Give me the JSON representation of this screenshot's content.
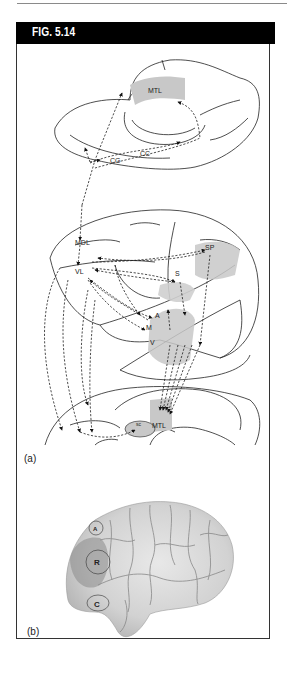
{
  "figure": {
    "title": "FIG. 5.14",
    "panels": [
      {
        "id": "a",
        "label": "(a)",
        "type": "schematic",
        "region_labels": [
          "MTL",
          "CC",
          "CG",
          "MDL",
          "VL",
          "SP",
          "S",
          "A",
          "M",
          "V",
          "MTL",
          "sc"
        ]
      },
      {
        "id": "b",
        "label": "(b)",
        "type": "brain-photo",
        "region_labels": [
          "A",
          "R",
          "C"
        ]
      }
    ]
  },
  "colors": {
    "header_bg": "#000000",
    "header_text": "#ffffff",
    "frame": "#333333",
    "shading": "#c8c8c8"
  }
}
